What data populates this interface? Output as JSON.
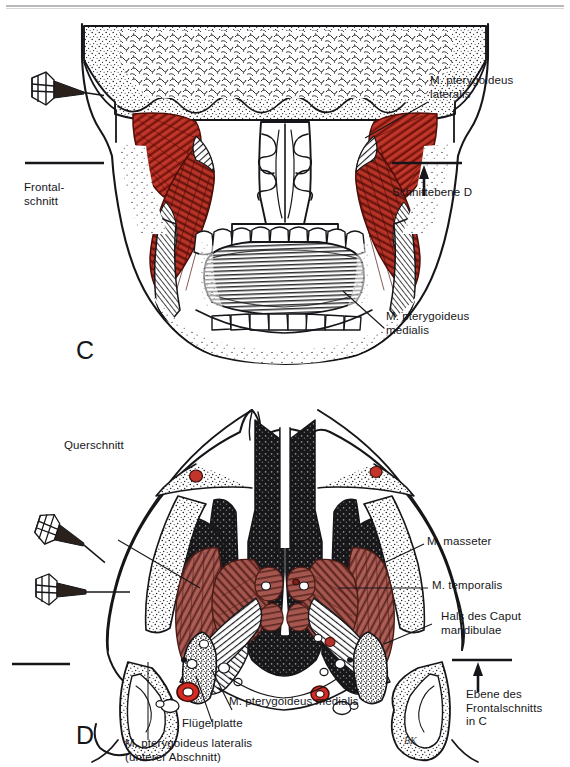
{
  "plate": {
    "background_color": "#ffffff",
    "ink_color": "#16161a",
    "muscle_color_top": "#b42b20",
    "muscle_color_bottom": "#a2544d",
    "vessel_color": "#d02a22",
    "top_rule_color": "#b9b9bd",
    "top_ghost_text": ""
  },
  "figure_c": {
    "panel_letter": "C",
    "caption_left": "Frontal-\nschnitt",
    "caption_right": "Schnittebene D",
    "labels": [
      {
        "id": "pterygoideus-lateralis",
        "text": "M. pterygoideus\nlateralis"
      },
      {
        "id": "pterygoideus-medialis",
        "text": "M. pterygoideus\nmedialis"
      }
    ],
    "view_markers": 1,
    "section_plane_marks": 2,
    "arrow_direction": "up"
  },
  "figure_d": {
    "panel_letter": "D",
    "caption_top_left": "Querschnitt",
    "caption_right": "Ebene des\nFrontalschnitts\nin C",
    "labels": [
      {
        "id": "masseter",
        "text": "M. masseter"
      },
      {
        "id": "temporalis",
        "text": "M. temporalis"
      },
      {
        "id": "hals-caput-mandibulae",
        "text": "Hals des Caput\nmandibulae"
      },
      {
        "id": "pterygoideus-medialis",
        "text": "M. pterygoideus medialis"
      },
      {
        "id": "fluegelplatte",
        "text": "Flügelplatte"
      },
      {
        "id": "pterygoideus-lateralis",
        "text": "M. pterygoideus lateralis\n(unterer Abschnitt)"
      }
    ],
    "signature": "BK",
    "view_markers": 2,
    "section_plane_marks": 2,
    "arrow_direction": "up"
  }
}
